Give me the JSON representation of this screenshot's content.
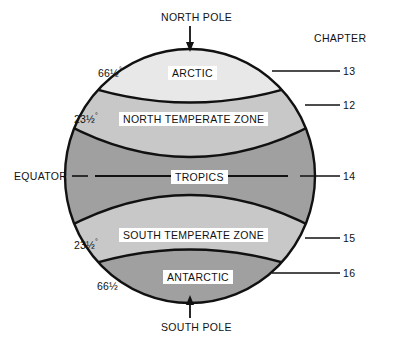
{
  "figure": {
    "type": "climate-zones-globe-diagram",
    "chapter_heading": "CHAPTER",
    "poles": {
      "north": "NORTH POLE",
      "south": "SOUTH POLE"
    },
    "equator_label": "EQUATOR",
    "latitudes": {
      "north_arctic_circle": "66½",
      "north_tropic": "23½",
      "south_tropic": "23½",
      "south_antarctic_circle": "66½",
      "degree_symbol": "°"
    },
    "zones": [
      {
        "name": "ARCTIC",
        "chapter": "13",
        "fill": "#e8e8e8"
      },
      {
        "name": "NORTH TEMPERATE ZONE",
        "chapter": "12",
        "fill": "#c8c8c8"
      },
      {
        "name": "TROPICS",
        "chapter": "14",
        "fill": "#a0a0a0"
      },
      {
        "name": "SOUTH TEMPERATE ZONE",
        "chapter": "15",
        "fill": "#c8c8c8"
      },
      {
        "name": "ANTARCTIC",
        "chapter": "16",
        "fill": "#a0a0a0"
      }
    ],
    "colors": {
      "outline": "#111111",
      "background": "#ffffff",
      "text": "#111111",
      "zone_lightest": "#e8e8e8",
      "zone_light": "#c8c8c8",
      "zone_dark": "#a0a0a0"
    }
  }
}
